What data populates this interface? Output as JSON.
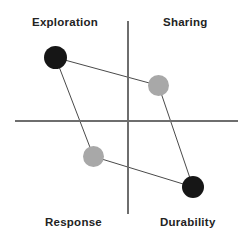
{
  "chart_data": {
    "type": "scatter",
    "title": "",
    "xlabel": "",
    "ylabel": "",
    "grid": false,
    "legend": "none",
    "xlim": [
      0,
      249
    ],
    "ylim": [
      0,
      241
    ],
    "axes": {
      "horizontal": {
        "y": 121,
        "x_start": 15,
        "x_end": 238,
        "color": "#6e6e6e",
        "width": 1.4
      },
      "vertical": {
        "x": 128,
        "y_start": 21,
        "y_end": 214,
        "color": "#6e6e6e",
        "width": 1.4
      }
    },
    "quadrant_labels": [
      {
        "id": "exploration",
        "text": "Exploration",
        "quadrant": "top-left",
        "x": 32,
        "y": 16
      },
      {
        "id": "sharing",
        "text": "Sharing",
        "quadrant": "top-right",
        "x": 163,
        "y": 16
      },
      {
        "id": "response",
        "text": "Response",
        "quadrant": "bottom-left",
        "x": 45,
        "y": 216
      },
      {
        "id": "durability",
        "text": "Durability",
        "quadrant": "bottom-right",
        "x": 160,
        "y": 216
      }
    ],
    "points": [
      {
        "id": "p-exploration",
        "label": "Exploration",
        "cx": 55.5,
        "cy": 57.5,
        "r": 11.5,
        "color": "#161616"
      },
      {
        "id": "p-sharing",
        "label": "Sharing",
        "cx": 158.5,
        "cy": 85.5,
        "r": 10.5,
        "color": "#a8a8a8"
      },
      {
        "id": "p-response",
        "label": "Response",
        "cx": 93.5,
        "cy": 156.5,
        "r": 10.5,
        "color": "#a8a8a8"
      },
      {
        "id": "p-durability",
        "label": "Durability",
        "cx": 193.0,
        "cy": 187.0,
        "r": 11.0,
        "color": "#161616"
      }
    ],
    "connections": [
      {
        "from": "p-exploration",
        "to": "p-sharing",
        "color": "#4a4a4a",
        "width": 1
      },
      {
        "from": "p-sharing",
        "to": "p-durability",
        "color": "#4a4a4a",
        "width": 1
      },
      {
        "from": "p-durability",
        "to": "p-response",
        "color": "#4a4a4a",
        "width": 1
      },
      {
        "from": "p-response",
        "to": "p-exploration",
        "color": "#4a4a4a",
        "width": 1
      }
    ],
    "colors": {
      "background": "#ffffff",
      "point_dark": "#161616",
      "point_light": "#a8a8a8",
      "axis": "#6e6e6e",
      "connector": "#4a4a4a",
      "text": "#232323"
    }
  }
}
